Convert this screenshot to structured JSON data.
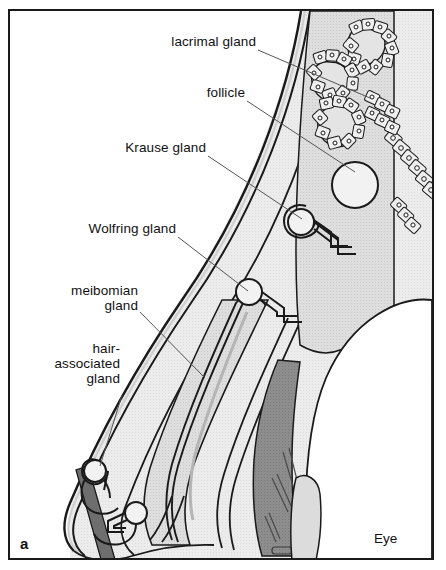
{
  "figure": {
    "panel_letter": "a",
    "type": "anatomical-cross-section"
  },
  "labels": [
    {
      "id": "lacrimal-gland",
      "text": "lacrimal gland",
      "x": 168,
      "y": 41,
      "align": "right",
      "leader": {
        "x1": 258,
        "y1": 50,
        "x2": 370,
        "y2": 98
      }
    },
    {
      "id": "follicle",
      "text": "follicle",
      "x": 196,
      "y": 92,
      "align": "right",
      "leader": {
        "x1": 247,
        "y1": 101,
        "x2": 355,
        "y2": 172
      }
    },
    {
      "id": "krause-gland",
      "text": "Krause gland",
      "x": 110,
      "y": 147,
      "align": "right",
      "leader": {
        "x1": 208,
        "y1": 156,
        "x2": 302,
        "y2": 219
      }
    },
    {
      "id": "wolfring-gland",
      "text": "Wolfring gland",
      "x": 80,
      "y": 228,
      "align": "right",
      "leader": {
        "x1": 178,
        "y1": 237,
        "x2": 248,
        "y2": 291
      }
    },
    {
      "id": "meibomian-gland",
      "text": "meibomian\ngland",
      "x": 39,
      "y": 289,
      "align": "right",
      "leader": {
        "x1": 140,
        "y1": 312,
        "x2": 205,
        "y2": 378
      }
    },
    {
      "id": "hair-associated-gland",
      "text": "hair-\nassociated\ngland",
      "x": 18,
      "y": 348,
      "align": "right",
      "leader": {
        "x1": 120,
        "y1": 395,
        "x2": 100,
        "y2": 465
      }
    }
  ],
  "region_labels": [
    {
      "id": "eye",
      "text": "Eye"
    }
  ],
  "colors": {
    "frame": "#1a1a1a",
    "outline": "#1a1a1a",
    "background": "#ffffff",
    "tissue_light": "#ebebeb",
    "tissue_mid": "#dcdcdc",
    "tissue_dark": "#9a9a9a",
    "conjunctiva_dark": "#8a8a8a",
    "lash_shaft": "#6e6e6e",
    "leader_line": "#555555",
    "text": "#111111"
  },
  "structures": [
    {
      "name": "lacrimal-gland-acini",
      "description": "branched acinar clusters of cuboidal secretory cells with nuclei, upper right"
    },
    {
      "name": "follicle",
      "description": "round lymphoid follicle in substantia propria"
    },
    {
      "name": "krause-gland",
      "description": "accessory lacrimal glands in fornix, bulb with duct"
    },
    {
      "name": "wolfring-gland",
      "description": "accessory lacrimal gland near tarsal border"
    },
    {
      "name": "meibomian-gland",
      "description": "elongated sebaceous gland within tarsal plate"
    },
    {
      "name": "hair-associated-gland",
      "description": "glands of Zeis/Moll associated with eyelash follicle"
    },
    {
      "name": "eyelash",
      "description": "dark cilium shaft exiting lid margin"
    },
    {
      "name": "conjunctival-epithelium",
      "description": "cell row lining palpebral/bulbar conjunctiva"
    },
    {
      "name": "cornea-globe",
      "description": "anterior eye surface at right"
    }
  ]
}
